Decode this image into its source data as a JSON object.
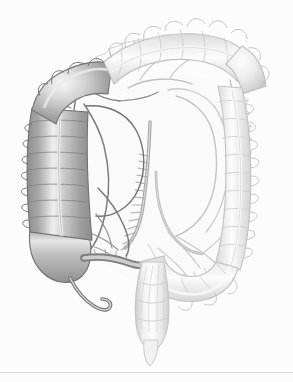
{
  "figure": {
    "style": "grayscale medical line and tone illustration",
    "background_color": "#ffffff",
    "canvas": {
      "width": 293,
      "height": 382
    },
    "caption": "Grayscale anatomical illustration of the large intestine showing cecum, appendix, ascending colon, hepatic flexure, transverse colon, splenic flexure, descending colon, sigmoid colon and rectum, with the mesenteric arterial arcades and vasa recta."
  },
  "palette": {
    "background": "#ffffff",
    "outline_dark": "#5a5a5a",
    "outline_mid": "#8e8e8e",
    "outline_light": "#b9b9b9",
    "outline_faint": "#cfcfcf",
    "tone_dark": "#9a9a9a",
    "tone_mid": "#c2c2c2",
    "tone_light": "#e2e2e2",
    "tone_pale": "#f1f1f1",
    "highlight": "#fdfdfd",
    "vessel_dark": "#7d7d7d",
    "vessel_light": "#bdbdbd",
    "footer_rule": "#d6d6d6"
  },
  "structures": [
    {
      "id": "cecum",
      "label": "Cecum",
      "region": "lower-left",
      "tone": "dark",
      "haustra": true
    },
    {
      "id": "appendix",
      "label": "Vermiform appendix",
      "region": "lower-left",
      "tone": "dark",
      "haustra": false
    },
    {
      "id": "terminal-ileum",
      "label": "Terminal ileum (cut)",
      "region": "lower-left-center",
      "tone": "dark",
      "haustra": false
    },
    {
      "id": "ascending-colon",
      "label": "Ascending colon",
      "region": "left",
      "tone": "dark",
      "haustra": true
    },
    {
      "id": "hepatic-flexure",
      "label": "Hepatic flexure (right colic flexure)",
      "region": "upper-left",
      "tone": "mid",
      "haustra": true
    },
    {
      "id": "transverse-colon",
      "label": "Transverse colon",
      "region": "top",
      "tone": "light",
      "haustra": true
    },
    {
      "id": "splenic-flexure",
      "label": "Splenic flexure (left colic flexure)",
      "region": "upper-right",
      "tone": "light",
      "haustra": true
    },
    {
      "id": "descending-colon",
      "label": "Descending colon",
      "region": "right",
      "tone": "light",
      "haustra": true
    },
    {
      "id": "sigmoid-colon",
      "label": "Sigmoid colon",
      "region": "lower-right-center",
      "tone": "light",
      "haustra": true
    },
    {
      "id": "rectum",
      "label": "Rectum",
      "region": "bottom-center",
      "tone": "light",
      "haustra": false
    },
    {
      "id": "anal-canal",
      "label": "Anal canal",
      "region": "bottom-center",
      "tone": "pale",
      "haustra": false
    },
    {
      "id": "superior-mesenteric-artery",
      "label": "Superior mesenteric artery",
      "region": "center",
      "tone": "vessel",
      "haustra": false
    },
    {
      "id": "inferior-mesenteric-artery",
      "label": "Inferior mesenteric artery",
      "region": "center-right",
      "tone": "vessel",
      "haustra": false
    },
    {
      "id": "marginal-artery",
      "label": "Marginal artery with vasa recta",
      "region": "perimeter",
      "tone": "vessel",
      "haustra": false
    },
    {
      "id": "mesentery",
      "label": "Mesentery / mesocolon",
      "region": "center",
      "tone": "pale",
      "haustra": false
    }
  ],
  "annotations": {
    "labels_visible": false,
    "callouts_visible": false,
    "text_present": false
  },
  "footer": {
    "rule_visible": true,
    "rule_color": "#d6d6d6"
  }
}
